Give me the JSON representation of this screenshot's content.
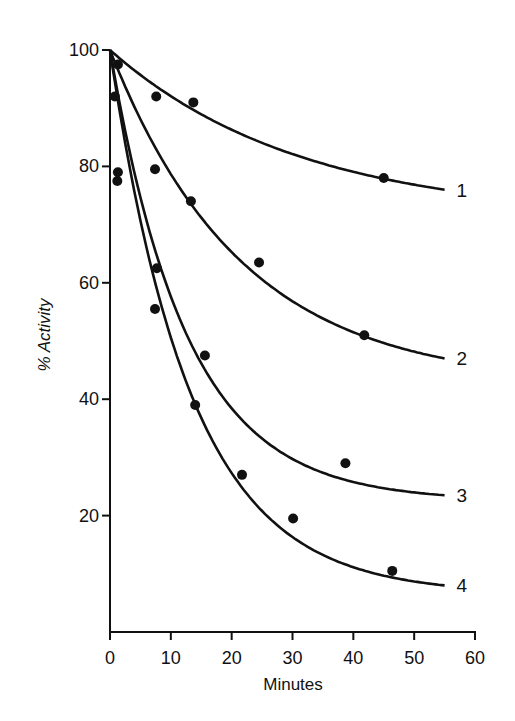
{
  "chart_data": {
    "type": "scatter",
    "title": "",
    "xlabel": "Minutes",
    "ylabel": "% Activity",
    "xlim": [
      0,
      60
    ],
    "ylim": [
      0,
      100
    ],
    "x_ticks": [
      0,
      10,
      20,
      30,
      40,
      50,
      60
    ],
    "y_ticks": [
      20,
      40,
      60,
      80,
      100
    ],
    "grid": false,
    "legend": "none (curves labeled inline at right end: 1, 2, 3, 4)",
    "series": [
      {
        "name": "1",
        "points": [
          [
            0,
            100
          ],
          [
            1.3,
            97.5
          ],
          [
            7.6,
            92
          ],
          [
            13.7,
            91
          ],
          [
            45,
            78
          ]
        ],
        "fit_end": [
          55,
          76
        ]
      },
      {
        "name": "2",
        "points": [
          [
            0,
            100
          ],
          [
            0.8,
            92
          ],
          [
            7.4,
            79.5
          ],
          [
            13.3,
            74
          ],
          [
            24.5,
            63.5
          ],
          [
            41.8,
            51
          ]
        ],
        "fit_end": [
          55,
          47
        ]
      },
      {
        "name": "3",
        "points": [
          [
            0,
            100
          ],
          [
            1.3,
            79
          ],
          [
            7.7,
            62.5
          ],
          [
            15.6,
            47.5
          ],
          [
            38.7,
            29
          ]
        ],
        "fit_end": [
          55,
          23.5
        ]
      },
      {
        "name": "4",
        "points": [
          [
            0,
            100
          ],
          [
            1.2,
            77.5
          ],
          [
            7.4,
            55.5
          ],
          [
            14,
            39
          ],
          [
            21.7,
            27
          ],
          [
            30.1,
            19.5
          ],
          [
            46.4,
            10.5
          ]
        ],
        "fit_end": [
          55,
          8
        ]
      }
    ]
  },
  "labels": {
    "xlabel": "Minutes",
    "ylabel": "% Activity",
    "x_ticks": [
      "0",
      "10",
      "20",
      "30",
      "40",
      "50",
      "60"
    ],
    "y_ticks": [
      "20",
      "40",
      "60",
      "80",
      "100"
    ],
    "curves": [
      "1",
      "2",
      "3",
      "4"
    ]
  }
}
